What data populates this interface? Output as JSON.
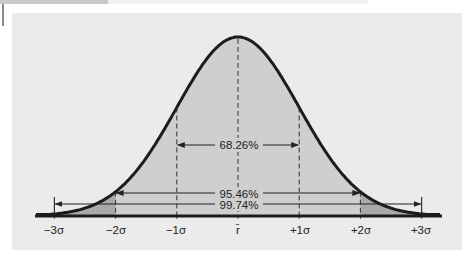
{
  "chart_data": {
    "type": "area",
    "title": "",
    "subtitle": "",
    "xlabel": "",
    "ylabel": "",
    "mean_label": "r̄",
    "x_ticks": [
      {
        "label": "−3σ",
        "sigma": -3
      },
      {
        "label": "−2σ",
        "sigma": -2
      },
      {
        "label": "−1σ",
        "sigma": -1
      },
      {
        "label": "r̄",
        "sigma": 0
      },
      {
        "label": "+1σ",
        "sigma": 1
      },
      {
        "label": "+2σ",
        "sigma": 2
      },
      {
        "label": "+3σ",
        "sigma": 3
      }
    ],
    "intervals": [
      {
        "label": "68.26%",
        "from_sigma": -1,
        "to_sigma": 1,
        "value": 68.26
      },
      {
        "label": "95.46%",
        "from_sigma": -2,
        "to_sigma": 2,
        "value": 95.46
      },
      {
        "label": "99.74%",
        "from_sigma": -3,
        "to_sigma": 3,
        "value": 99.74
      }
    ],
    "shaded_regions": [
      {
        "name": "within-2-sigma",
        "from_sigma": -2,
        "to_sigma": 2,
        "color": "#cfcfcf"
      },
      {
        "name": "tails-2-to-3-sigma",
        "from_sigma": 2,
        "to_sigma": 3,
        "color": "#a9a9a9",
        "symmetric": true
      }
    ],
    "xlim_sigma": [
      -3.3,
      3.3
    ],
    "grid": false,
    "legend": null
  },
  "labels": {
    "tick_m3": "−3σ",
    "tick_m2": "−2σ",
    "tick_m1": "−1σ",
    "tick_0": "r̄",
    "tick_p1": "+1σ",
    "tick_p2": "+2σ",
    "tick_p3": "+3σ",
    "pct_68": "68.26%",
    "pct_95": "95.46%",
    "pct_99": "99.74%"
  },
  "colors": {
    "panel": "#ebebeb",
    "fill_main": "#cfcfcf",
    "fill_tail": "#a9a9a9",
    "curve": "#1c1c1c",
    "lines": "#333333"
  }
}
